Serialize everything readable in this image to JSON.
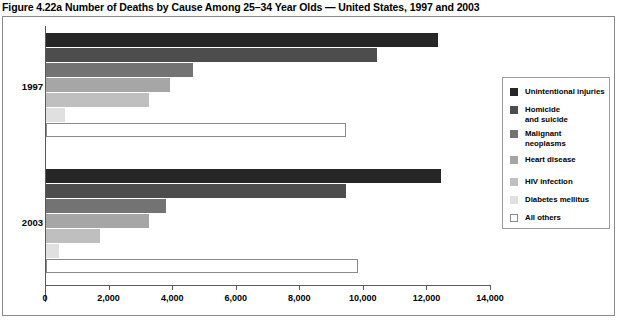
{
  "figure": {
    "title": "Figure 4.22a Number of Deaths by Cause Among 25–34 Year Olds — United States, 1997 and 2003"
  },
  "axis": {
    "tick_labels": [
      "0",
      "2,000",
      "4,000",
      "6,000",
      "8,000",
      "10,000",
      "12,000",
      "14,000"
    ],
    "group_labels": [
      "1997",
      "2003"
    ]
  },
  "legend": {
    "items": [
      {
        "label": "Unintentional injuries",
        "color": "#262626"
      },
      {
        "label": "Homicide\nand suicide",
        "color": "#4d4d4d"
      },
      {
        "label": "Malignant\nneoplasms",
        "color": "#737373"
      },
      {
        "label": "Heart disease",
        "color": "#a6a6a6"
      },
      {
        "label": "HIV infection",
        "color": "#bfbfbf"
      },
      {
        "label": "Diabetes mellitus",
        "color": "#e0e0e0"
      },
      {
        "label": "All others",
        "color": "#ffffff"
      }
    ]
  },
  "chart_data": {
    "type": "bar",
    "orientation": "horizontal",
    "title": "Figure 4.22a Number of Deaths by Cause Among 25–34 Year Olds — United States, 1997 and 2003",
    "xlabel": "",
    "ylabel": "",
    "xlim": [
      0,
      14000
    ],
    "xticks": [
      0,
      2000,
      4000,
      6000,
      8000,
      10000,
      12000,
      14000
    ],
    "grid": false,
    "legend_position": "right",
    "categories": [
      "1997",
      "2003"
    ],
    "series": [
      {
        "name": "Unintentional injuries",
        "color": "#262626",
        "values": [
          12330,
          12420
        ]
      },
      {
        "name": "Homicide and suicide",
        "color": "#4d4d4d",
        "values": [
          10400,
          9450
        ]
      },
      {
        "name": "Malignant neoplasms",
        "color": "#737373",
        "values": [
          4620,
          3760
        ]
      },
      {
        "name": "Heart disease",
        "color": "#a6a6a6",
        "values": [
          3890,
          3250
        ]
      },
      {
        "name": "HIV infection",
        "color": "#bfbfbf",
        "values": [
          3230,
          1700
        ]
      },
      {
        "name": "Diabetes mellitus",
        "color": "#e0e0e0",
        "values": [
          600,
          420
        ]
      },
      {
        "name": "All others",
        "color": "#ffffff",
        "values": [
          9450,
          9830
        ]
      }
    ]
  }
}
